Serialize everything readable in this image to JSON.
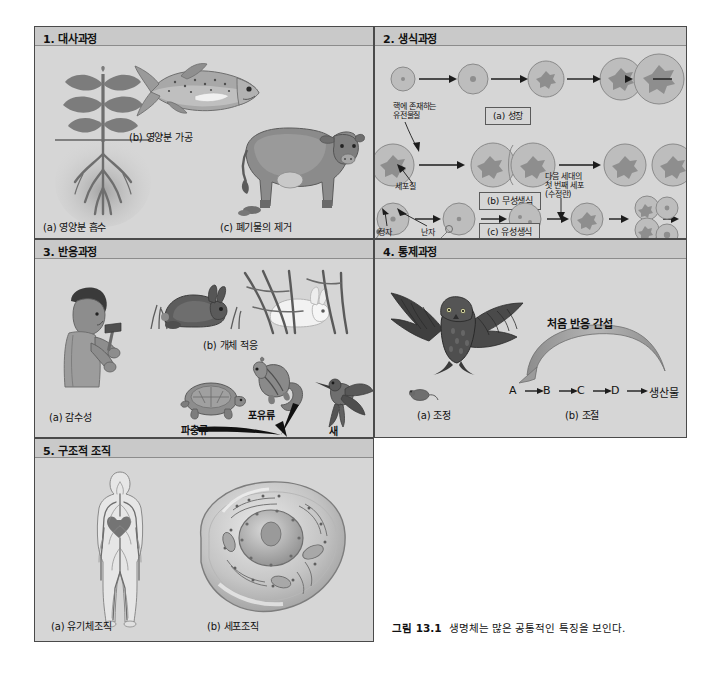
{
  "figure": {
    "caption_number": "그림 13.1",
    "caption_text": "생명체는 많은 공통적인 특징을 보인다."
  },
  "panels": [
    {
      "id": "panel1",
      "title": "1. 대사과정",
      "labels": {
        "a": "(a) 영양분 흡수",
        "b": "(b) 영양분 가공",
        "c": "(c) 폐기물의 제거"
      }
    },
    {
      "id": "panel2",
      "title": "2. 생식과정",
      "labels": {
        "genetic_material": "핵에 존재하는\n유전물질",
        "genetic_material_line1": "핵에 존재하는",
        "genetic_material_line2": "유전물질",
        "cytoplasm": "세포질",
        "sperm": "정자",
        "egg": "난자",
        "zygote_line1": "다음 세대의",
        "zygote_line2": "첫 번째 세포",
        "zygote_line3": "(수정란)",
        "a": "(a) 성장",
        "b": "(b) 무성생식",
        "c": "(c) 유성생식"
      }
    },
    {
      "id": "panel3",
      "title": "3. 반응과정",
      "labels": {
        "a": "(a) 감수성",
        "b": "(b) 개체 적응",
        "c": "(c) 개체군 적응(진화)",
        "reptile": "파충류",
        "mammal": "포유류",
        "bird": "새"
      }
    },
    {
      "id": "panel4",
      "title": "4. 통제과정",
      "labels": {
        "a": "(a) 조정",
        "b": "(b) 조절",
        "feedback": "처음 반응 간섭",
        "chain": [
          "A",
          "B",
          "C",
          "D",
          "생산물"
        ]
      }
    },
    {
      "id": "panel5",
      "title": "5. 구조적 조직",
      "labels": {
        "a": "(a) 유기체조직",
        "b": "(b) 세포조직"
      }
    }
  ],
  "colors": {
    "page_background": "#ffffff",
    "panel_background": "#d4d4d4",
    "panel_header": "#c9c9c9",
    "panel_border": "#4a4a4a",
    "text": "#111111",
    "cell_fill": "#bdbdbd",
    "arrow": "#1c1c1c",
    "feedback_arrow": "#9a9a9a"
  }
}
